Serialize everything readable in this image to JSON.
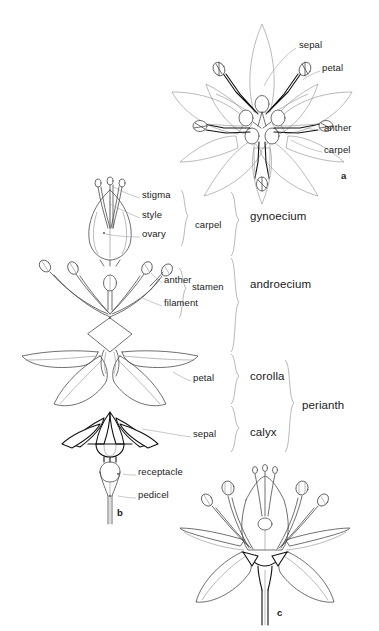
{
  "figure": {
    "background_color": "#ffffff",
    "ink_color": "#3a3a3a",
    "text_color": "#1a1a1a",
    "width": 379,
    "height": 631
  },
  "panels": [
    {
      "id": "a",
      "label": "a",
      "x": 341,
      "y": 176,
      "description": "face view of flower showing radial arrangement of sepals, petals, stamens and carpels"
    },
    {
      "id": "b",
      "label": "b",
      "x": 117,
      "y": 512,
      "description": "exploded longitudinal dissection: gynoecium, androecium, corolla, calyx, receptacle and pedicel"
    },
    {
      "id": "c",
      "label": "c",
      "x": 277,
      "y": 612,
      "description": "longitudinal section of intact flower"
    }
  ],
  "callouts": [
    {
      "text": "sepal",
      "x": 299,
      "y": 44,
      "anchor_x": 264,
      "anchor_y": 88,
      "panel": "a"
    },
    {
      "text": "petal",
      "x": 322,
      "y": 67,
      "anchor_x": 302,
      "anchor_y": 80,
      "panel": "a"
    },
    {
      "text": "anther",
      "x": 324,
      "y": 127,
      "anchor_x": 304,
      "anchor_y": 128,
      "panel": "a"
    },
    {
      "text": "carpel",
      "x": 324,
      "y": 149,
      "anchor_x": 290,
      "anchor_y": 140,
      "panel": "a"
    },
    {
      "text": "stigma",
      "x": 142,
      "y": 194,
      "anchor_x": 112,
      "anchor_y": 186,
      "panel": "b"
    },
    {
      "text": "style",
      "x": 142,
      "y": 214,
      "anchor_x": 110,
      "anchor_y": 204,
      "panel": "b"
    },
    {
      "text": "ovary",
      "x": 142,
      "y": 233,
      "anchor_x": 104,
      "anchor_y": 233,
      "panel": "b"
    },
    {
      "text": "anther",
      "x": 164,
      "y": 279,
      "anchor_x": 150,
      "anchor_y": 272,
      "panel": "b"
    },
    {
      "text": "filament",
      "x": 164,
      "y": 302,
      "anchor_x": 140,
      "anchor_y": 296,
      "panel": "b"
    },
    {
      "text": "petal",
      "x": 193,
      "y": 377,
      "anchor_x": 172,
      "anchor_y": 372,
      "panel": "b"
    },
    {
      "text": "sepal",
      "x": 193,
      "y": 433,
      "anchor_x": 140,
      "anchor_y": 428,
      "panel": "b"
    },
    {
      "text": "receptacle",
      "x": 138,
      "y": 471,
      "anchor_x": 122,
      "anchor_y": 474,
      "panel": "b"
    },
    {
      "text": "pedicel",
      "x": 138,
      "y": 494,
      "anchor_x": 117,
      "anchor_y": 496,
      "panel": "b"
    }
  ],
  "brackets": [
    {
      "text": "carpel",
      "text_x": 195,
      "text_y": 224,
      "x": 184,
      "top": 190,
      "bottom": 246,
      "size": "small"
    },
    {
      "text": "stamen",
      "text_x": 192,
      "text_y": 286,
      "x": 182,
      "top": 268,
      "bottom": 318,
      "size": "small"
    },
    {
      "text": "gynoecium",
      "text_x": 250,
      "text_y": 217,
      "x": 234,
      "top": 192,
      "bottom": 256,
      "size": "big"
    },
    {
      "text": "androecium",
      "text_x": 250,
      "text_y": 285,
      "x": 234,
      "top": 258,
      "bottom": 352,
      "size": "big"
    },
    {
      "text": "corolla",
      "text_x": 250,
      "text_y": 377,
      "x": 234,
      "top": 354,
      "bottom": 404,
      "size": "big"
    },
    {
      "text": "calyx",
      "text_x": 250,
      "text_y": 433,
      "x": 234,
      "top": 406,
      "bottom": 452,
      "size": "big"
    },
    {
      "text": "perianth",
      "text_x": 302,
      "text_y": 406,
      "x": 288,
      "top": 360,
      "bottom": 452,
      "size": "big"
    }
  ],
  "footer": {
    "text": "",
    "note": "partially cropped faint text row at the very bottom edge"
  }
}
